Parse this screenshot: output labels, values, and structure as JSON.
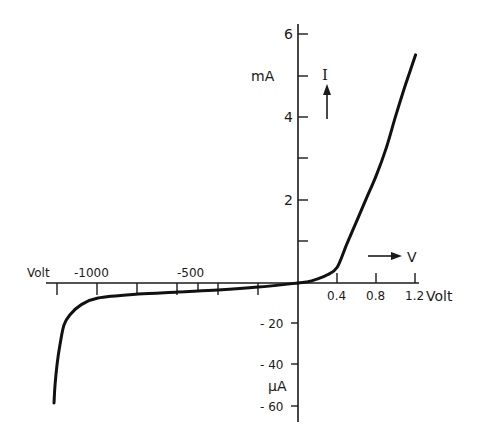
{
  "chart_data": {
    "type": "line",
    "title": "",
    "xlabel": "Volt",
    "ylabel_forward": "mA",
    "ylabel_reverse": "μA",
    "axis_arrows": {
      "x": "V",
      "y": "I"
    },
    "forward": {
      "x_unit": "Volt",
      "y_unit": "mA",
      "x_ticks": [
        0.4,
        0.8,
        1.2
      ],
      "x_tick_labels": [
        "0.4",
        "0.8",
        "1.2"
      ],
      "y_ticks": [
        1,
        2,
        3,
        4,
        5,
        6
      ],
      "y_tick_labels": [
        "2",
        "4",
        "6"
      ],
      "xlim": [
        0,
        1.2
      ],
      "ylim": [
        0,
        6
      ],
      "points": [
        {
          "v": 0.0,
          "i": 0.0
        },
        {
          "v": 0.1,
          "i": 0.03
        },
        {
          "v": 0.2,
          "i": 0.1
        },
        {
          "v": 0.3,
          "i": 0.2
        },
        {
          "v": 0.4,
          "i": 0.38
        },
        {
          "v": 0.5,
          "i": 0.95
        },
        {
          "v": 0.6,
          "i": 1.5
        },
        {
          "v": 0.7,
          "i": 2.05
        },
        {
          "v": 0.8,
          "i": 2.6
        },
        {
          "v": 0.9,
          "i": 3.25
        },
        {
          "v": 1.0,
          "i": 4.05
        },
        {
          "v": 1.1,
          "i": 4.8
        },
        {
          "v": 1.2,
          "i": 5.5
        }
      ]
    },
    "reverse": {
      "x_unit": "Volt",
      "y_unit": "μA",
      "x_ticks": [
        -1200,
        -1000,
        -800,
        -600,
        -500,
        -400,
        -200
      ],
      "x_tick_labels": [
        "-1000",
        "-500"
      ],
      "y_ticks": [
        -20,
        -40,
        -60
      ],
      "y_tick_labels": [
        "-20",
        "-40",
        "-60"
      ],
      "xlim": [
        -1220,
        0
      ],
      "ylim": [
        -60,
        0
      ],
      "points": [
        {
          "v": 0,
          "i": 0.0
        },
        {
          "v": -200,
          "i": -2.0
        },
        {
          "v": -400,
          "i": -3.4
        },
        {
          "v": -600,
          "i": -4.4
        },
        {
          "v": -800,
          "i": -5.4
        },
        {
          "v": -1000,
          "i": -7.3
        },
        {
          "v": -1085,
          "i": -10.7
        },
        {
          "v": -1140,
          "i": -15.5
        },
        {
          "v": -1170,
          "i": -20.5
        },
        {
          "v": -1190,
          "i": -30
        },
        {
          "v": -1205,
          "i": -40
        },
        {
          "v": -1215,
          "i": -50
        },
        {
          "v": -1220,
          "i": -58.5
        }
      ]
    },
    "grid": false,
    "legend": null
  },
  "labels": {
    "y_top": "6",
    "y_mid": "4",
    "y_low": "2",
    "y_unit_forward": "mA",
    "y_arrow_label": "I",
    "x_arrow_label": "V",
    "x_unit_left": "Volt",
    "x_unit_right": "Volt",
    "x_neg_1000": "-1000",
    "x_neg_500": "-500",
    "x_pos_04": "0.4",
    "x_pos_08": "0.8",
    "x_pos_12": "1.2",
    "y_neg_20": "- 20",
    "y_neg_40": "- 40",
    "y_neg_60": "- 60",
    "y_unit_reverse": "μA"
  }
}
